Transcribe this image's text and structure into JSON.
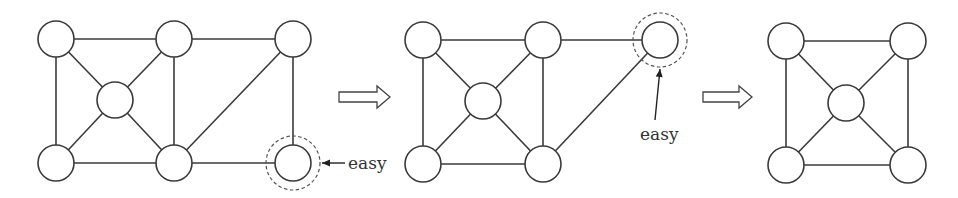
{
  "diagram": {
    "type": "graph-reduction-sequence",
    "colors": {
      "stroke": "#3a3a3a",
      "node_fill": "#ffffff",
      "background": "#ffffff"
    },
    "graphs": [
      {
        "id": "g1",
        "nodes": [
          {
            "id": "TL",
            "x": 56,
            "y": 39
          },
          {
            "id": "TM",
            "x": 174,
            "y": 39
          },
          {
            "id": "TR",
            "x": 293,
            "y": 39
          },
          {
            "id": "C",
            "x": 115,
            "y": 100
          },
          {
            "id": "BL",
            "x": 56,
            "y": 163
          },
          {
            "id": "BM",
            "x": 174,
            "y": 163
          },
          {
            "id": "BR",
            "x": 293,
            "y": 163
          }
        ],
        "edges": [
          [
            "TL",
            "TM"
          ],
          [
            "TM",
            "TR"
          ],
          [
            "TL",
            "BL"
          ],
          [
            "TL",
            "C"
          ],
          [
            "TM",
            "C"
          ],
          [
            "C",
            "BL"
          ],
          [
            "C",
            "BM"
          ],
          [
            "TM",
            "BM"
          ],
          [
            "TR",
            "BM"
          ],
          [
            "TR",
            "BR"
          ],
          [
            "BL",
            "BM"
          ],
          [
            "BM",
            "BR"
          ]
        ],
        "highlighted": "BR",
        "annotation": {
          "text": "easy",
          "arrow_from": [
            345,
            163
          ],
          "arrow_to": [
            322,
            163
          ],
          "text_x": 348,
          "text_y": 169
        }
      },
      {
        "id": "g2",
        "nodes": [
          {
            "id": "TL",
            "x": 423,
            "y": 40
          },
          {
            "id": "TM",
            "x": 543,
            "y": 40
          },
          {
            "id": "TR",
            "x": 660,
            "y": 40
          },
          {
            "id": "C",
            "x": 483,
            "y": 101
          },
          {
            "id": "BL",
            "x": 423,
            "y": 164
          },
          {
            "id": "BM",
            "x": 543,
            "y": 164
          }
        ],
        "edges": [
          [
            "TL",
            "TM"
          ],
          [
            "TM",
            "TR"
          ],
          [
            "TL",
            "BL"
          ],
          [
            "TL",
            "C"
          ],
          [
            "TM",
            "C"
          ],
          [
            "C",
            "BL"
          ],
          [
            "C",
            "BM"
          ],
          [
            "TM",
            "BM"
          ],
          [
            "TR",
            "BM"
          ],
          [
            "BL",
            "BM"
          ]
        ],
        "highlighted": "TR",
        "annotation": {
          "text": "easy",
          "arrow_from": [
            655,
            120
          ],
          "arrow_to": [
            660,
            69
          ],
          "text_x": 640,
          "text_y": 140
        }
      },
      {
        "id": "g3",
        "nodes": [
          {
            "id": "TL",
            "x": 786,
            "y": 41
          },
          {
            "id": "TR",
            "x": 908,
            "y": 41
          },
          {
            "id": "C",
            "x": 846,
            "y": 103
          },
          {
            "id": "BL",
            "x": 786,
            "y": 165
          },
          {
            "id": "BR",
            "x": 908,
            "y": 165
          }
        ],
        "edges": [
          [
            "TL",
            "TR"
          ],
          [
            "TL",
            "BL"
          ],
          [
            "TR",
            "BR"
          ],
          [
            "BL",
            "BR"
          ],
          [
            "TL",
            "C"
          ],
          [
            "TR",
            "C"
          ],
          [
            "BL",
            "C"
          ],
          [
            "BR",
            "C"
          ]
        ],
        "highlighted": null
      }
    ],
    "transition_arrows": [
      {
        "x1": 339,
        "x2": 390,
        "y": 97
      },
      {
        "x1": 703,
        "x2": 752,
        "y": 97
      }
    ],
    "node_radius": 18,
    "ring_radius": 27
  }
}
